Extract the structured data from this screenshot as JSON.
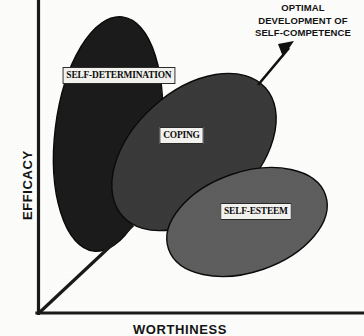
{
  "figure": {
    "title_annotation": {
      "lines": [
        "OPTIMAL",
        "DEVELOPMENT OF",
        "SELF-COMPETENCE"
      ]
    },
    "axes": {
      "y_label": "EFFICACY",
      "x_label": "WORTHINESS"
    },
    "regions": [
      {
        "id": "self-determination",
        "label": "SELF-DETERMINATION",
        "color": "#1b1b1b"
      },
      {
        "id": "coping",
        "label": "COPING",
        "color": "#3a3a3a"
      },
      {
        "id": "self-esteem",
        "label": "SELF-ESTEEM",
        "color": "#5e5e5e"
      }
    ],
    "colors": {
      "background": "#fdfdfc",
      "axis": "#1a1a1a",
      "label_box_fill": "#f2f1ee",
      "label_text": "#0c0c0c",
      "arrow": "#101010"
    }
  }
}
